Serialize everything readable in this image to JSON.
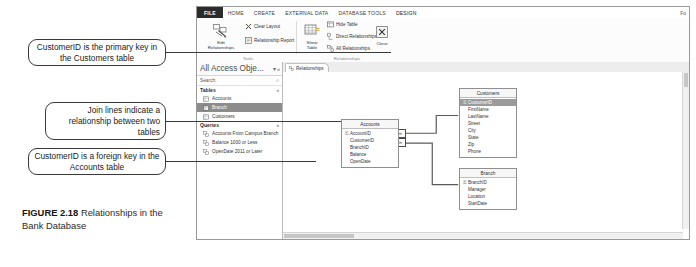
{
  "figure": {
    "label": "FIGURE 2.18",
    "caption": "Relationships in the Bank Database"
  },
  "callouts": [
    {
      "id": "callout-1",
      "text": "CustomerID is the primary key in the Customers table"
    },
    {
      "id": "callout-2",
      "text": "Join lines indicate a relationship between two tables"
    },
    {
      "id": "callout-3",
      "text": "CustomerID is a foreign key in the Accounts table"
    }
  ],
  "app": {
    "ribbon_tabs": [
      {
        "label": "FILE",
        "state": "file"
      },
      {
        "label": "HOME",
        "state": "normal"
      },
      {
        "label": "CREATE",
        "state": "normal"
      },
      {
        "label": "EXTERNAL DATA",
        "state": "normal"
      },
      {
        "label": "DATABASE TOOLS",
        "state": "normal"
      },
      {
        "label": "DESIGN",
        "state": "active"
      }
    ],
    "ribbon_far_right": "Fo",
    "groups": {
      "tools": {
        "label": "Tools",
        "edit_relationships": "Edit\nRelationships",
        "clear_layout": "Clear Layout",
        "relationship_report": "Relationship Report"
      },
      "relationships": {
        "label": "Relationships",
        "show_table": "Show\nTable",
        "hide_table": "Hide Table",
        "direct_relationships": "Direct Relationships",
        "all_relationships": "All Relationships",
        "close": "Close"
      }
    },
    "nav_pane": {
      "title": "All Access Obje...",
      "search_value": "Search.",
      "search_icon": "search-icon",
      "groups": [
        {
          "name": "Tables",
          "collapse": "«",
          "items": [
            {
              "label": "Accounts",
              "icon": "table-icon",
              "selected": false
            },
            {
              "label": "Branch",
              "icon": "table-icon",
              "selected": true
            },
            {
              "label": "Customers",
              "icon": "table-icon",
              "selected": false
            }
          ]
        },
        {
          "name": "Queries",
          "collapse": "«",
          "items": [
            {
              "label": "Accounts From Campus Branch",
              "icon": "query-icon",
              "selected": false
            },
            {
              "label": "Balance 1000 or Less",
              "icon": "query-icon",
              "selected": false
            },
            {
              "label": "OpenDate 2011 or Later",
              "icon": "query-icon",
              "selected": false
            }
          ]
        }
      ]
    },
    "document_tabs": [
      {
        "label": "Relationships",
        "icon": "relationships-icon",
        "active": true
      }
    ],
    "tables": [
      {
        "name": "Customers",
        "fields": [
          {
            "name": "CustomerID",
            "primary_key": true
          },
          {
            "name": "FirstName",
            "primary_key": false
          },
          {
            "name": "LastName",
            "primary_key": false
          },
          {
            "name": "Street",
            "primary_key": false
          },
          {
            "name": "City",
            "primary_key": false
          },
          {
            "name": "State",
            "primary_key": false
          },
          {
            "name": "Zip",
            "primary_key": false
          },
          {
            "name": "Phone",
            "primary_key": false
          }
        ]
      },
      {
        "name": "Accounts",
        "fields": [
          {
            "name": "AccountID",
            "primary_key": true
          },
          {
            "name": "CustomerID",
            "primary_key": false
          },
          {
            "name": "BranchID",
            "primary_key": false
          },
          {
            "name": "Balance",
            "primary_key": false
          },
          {
            "name": "OpenDate",
            "primary_key": false
          }
        ]
      },
      {
        "name": "Branch",
        "fields": [
          {
            "name": "BranchID",
            "primary_key": true
          },
          {
            "name": "Manager",
            "primary_key": false
          },
          {
            "name": "Location",
            "primary_key": false
          },
          {
            "name": "StartDate",
            "primary_key": false
          }
        ]
      }
    ],
    "join_markers": {
      "one": "1",
      "many": "∞"
    }
  },
  "colors": {
    "file_tab": "#2b2b2b",
    "selection": "#8c8c8c",
    "pk_row": "#9b9b9b",
    "window_border": "#9a9a9a",
    "callout_border": "#3a3a3a"
  }
}
